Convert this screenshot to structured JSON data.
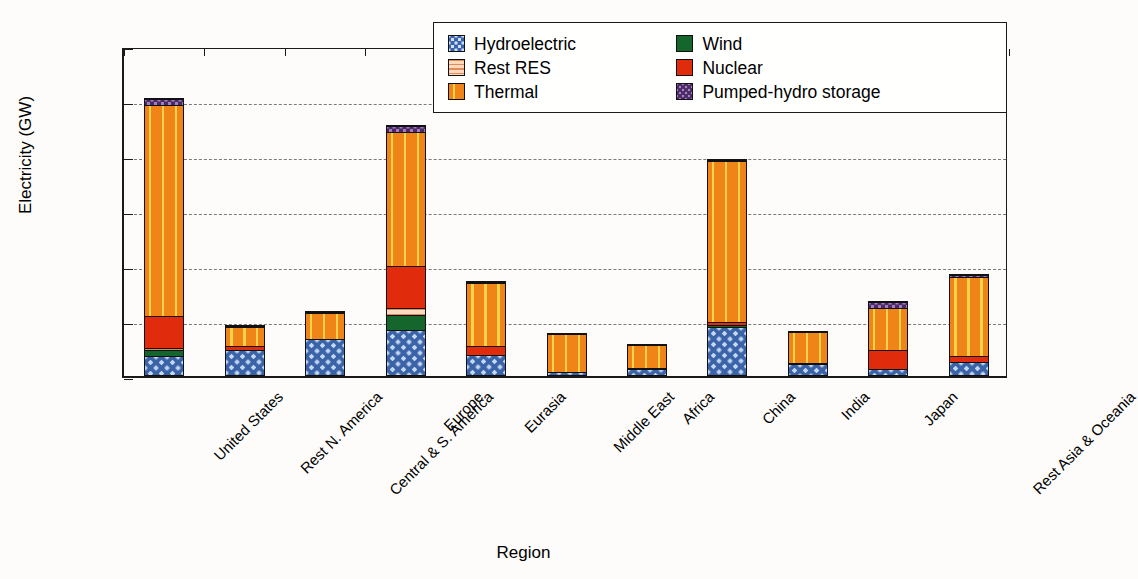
{
  "chart_data": {
    "type": "bar",
    "stacked": true,
    "title": "",
    "xlabel": "Region",
    "ylabel": "Electricity (GW)",
    "ylim": [
      0,
      1200
    ],
    "yticks": [
      0,
      200,
      400,
      600,
      800,
      1000,
      1200
    ],
    "grid": "horizontal dashed",
    "legend_position": "top-right inside plot",
    "categories": [
      "United States",
      "Rest N. America",
      "Central & S. America",
      "Europe",
      "Eurasia",
      "Middle East",
      "Africa",
      "China",
      "India",
      "Japan",
      "Rest Asia & Oceania"
    ],
    "series": [
      {
        "name": "Hydroelectric",
        "color": "#3a63a8",
        "values": [
          70,
          95,
          138,
          165,
          73,
          10,
          25,
          175,
          40,
          22,
          50
        ]
      },
      {
        "name": "Wind",
        "color": "#14662c",
        "values": [
          22,
          0,
          0,
          55,
          0,
          0,
          0,
          8,
          0,
          0,
          0
        ]
      },
      {
        "name": "Rest RES",
        "color": "#fbd9bc",
        "values": [
          8,
          0,
          0,
          25,
          0,
          0,
          0,
          0,
          0,
          0,
          0
        ]
      },
      {
        "name": "Nuclear",
        "color": "#e02b0c",
        "values": [
          115,
          15,
          0,
          155,
          37,
          0,
          2,
          10,
          4,
          73,
          22
        ]
      },
      {
        "name": "Thermal",
        "color": "#ef8418",
        "values": [
          775,
          70,
          95,
          490,
          232,
          147,
          90,
          592,
          118,
          155,
          290
        ]
      },
      {
        "name": "Pumped-hydro storage",
        "color": "#4a2a64",
        "values": [
          20,
          6,
          2,
          22,
          2,
          0,
          0,
          4,
          0,
          23,
          8
        ]
      }
    ],
    "totals": [
      1010,
      186,
      235,
      912,
      344,
      157,
      117,
      789,
      162,
      273,
      370
    ]
  },
  "legend": {
    "entries": [
      {
        "label": "Hydroelectric",
        "swatch": "sw-hydro"
      },
      {
        "label": "Wind",
        "swatch": "sw-wind"
      },
      {
        "label": "Rest RES",
        "swatch": "sw-res"
      },
      {
        "label": "Nuclear",
        "swatch": "sw-nuclear"
      },
      {
        "label": "Thermal",
        "swatch": "sw-thermal"
      },
      {
        "label": "Pumped-hydro storage",
        "swatch": "sw-pumped"
      }
    ]
  }
}
